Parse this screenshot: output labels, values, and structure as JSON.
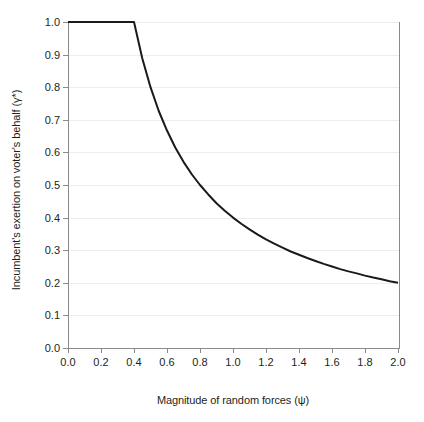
{
  "chart_data": {
    "type": "line",
    "title": "",
    "xlabel": "Magnitude of random forces (ψ)",
    "ylabel": "Incumbent's exertion on voter's behalf (γ*)",
    "xlim": [
      0.0,
      2.0
    ],
    "ylim": [
      0.0,
      1.0
    ],
    "grid": true,
    "legend": "none",
    "line_color": "#1a1a1a",
    "grid_color": "#ededed",
    "axis_color": "#8a8a8a",
    "xticks": [
      "0.0",
      "0.2",
      "0.4",
      "0.6",
      "0.8",
      "1.0",
      "1.2",
      "1.4",
      "1.6",
      "1.8",
      "2.0"
    ],
    "xtick_values": [
      0.0,
      0.2,
      0.4,
      0.6,
      0.8,
      1.0,
      1.2,
      1.4,
      1.6,
      1.8,
      2.0
    ],
    "yticks": [
      "0.0",
      "0.1",
      "0.2",
      "0.3",
      "0.4",
      "0.5",
      "0.6",
      "0.7",
      "0.8",
      "0.9",
      "1.0"
    ],
    "ytick_values": [
      0.0,
      0.1,
      0.2,
      0.3,
      0.4,
      0.5,
      0.6,
      0.7,
      0.8,
      0.9,
      1.0
    ],
    "series": [
      {
        "name": "Optimal exertion",
        "x": [
          0.0,
          0.1,
          0.2,
          0.3,
          0.4,
          0.45,
          0.5,
          0.55,
          0.6,
          0.65,
          0.7,
          0.75,
          0.8,
          0.85,
          0.9,
          0.95,
          1.0,
          1.05,
          1.1,
          1.15,
          1.2,
          1.25,
          1.3,
          1.35,
          1.4,
          1.45,
          1.5,
          1.55,
          1.6,
          1.65,
          1.7,
          1.75,
          1.8,
          1.85,
          1.9,
          1.95,
          2.0
        ],
        "values": [
          1.0,
          1.0,
          1.0,
          1.0,
          1.0,
          0.889,
          0.8,
          0.727,
          0.667,
          0.615,
          0.571,
          0.533,
          0.5,
          0.471,
          0.444,
          0.421,
          0.4,
          0.381,
          0.364,
          0.348,
          0.333,
          0.32,
          0.308,
          0.296,
          0.286,
          0.276,
          0.267,
          0.258,
          0.25,
          0.242,
          0.235,
          0.229,
          0.222,
          0.216,
          0.211,
          0.205,
          0.2
        ]
      }
    ],
    "annotations": [
      {
        "text": "flat at γ* = 1.0 for ψ ≤ 0.4",
        "x": 0.2,
        "y": 1.0
      },
      {
        "text": "γ* = 0.4/ψ for ψ > 0.4",
        "x": 1.2,
        "y": 0.333
      }
    ]
  }
}
